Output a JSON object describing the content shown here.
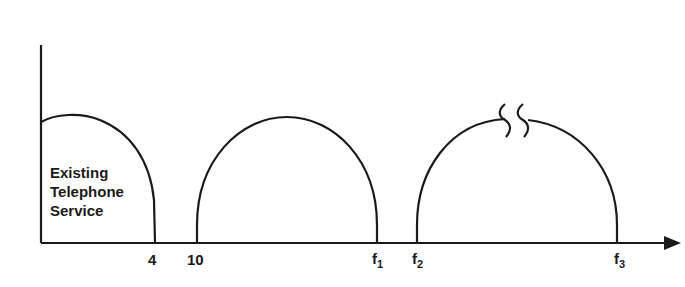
{
  "diagram": {
    "title": "",
    "axis": {
      "x_arrow": true,
      "y_axis": true
    },
    "bands": [
      {
        "name": "existing-telephone-service",
        "label_lines": [
          "Existing",
          "Telephone",
          "Service"
        ],
        "start_label": "",
        "end_label": "4"
      },
      {
        "name": "band-2",
        "start_label": "10",
        "end_label": "f",
        "end_sub": "1"
      },
      {
        "name": "band-3",
        "start_label": "f",
        "start_sub": "2",
        "end_label": "f",
        "end_sub": "3",
        "break_marks": true
      }
    ],
    "tick_labels": [
      {
        "text": "4",
        "sub": ""
      },
      {
        "text": "10",
        "sub": ""
      },
      {
        "text": "f",
        "sub": "1"
      },
      {
        "text": "f",
        "sub": "2"
      },
      {
        "text": "f",
        "sub": "3"
      }
    ],
    "colors": {
      "stroke": "#1a1a1a",
      "background": "#ffffff"
    }
  }
}
